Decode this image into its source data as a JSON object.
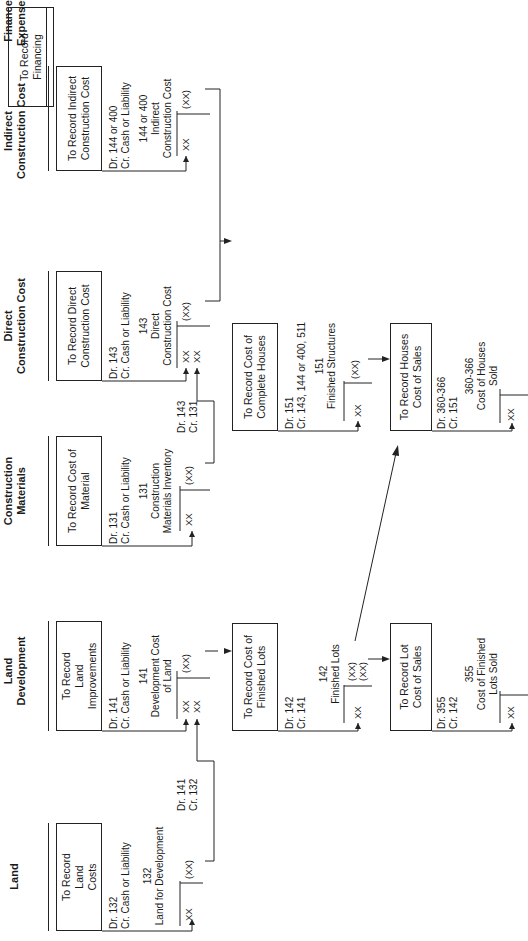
{
  "columns": [
    {
      "header": "Land",
      "box": "To Record Land Costs",
      "entry": [
        "Dr. 132",
        "Cr. Cash or Liability"
      ],
      "account": [
        "132",
        "Land for Development"
      ],
      "debits": [
        "XX"
      ],
      "credits": [
        "(XX)"
      ]
    },
    {
      "header": "Land Development",
      "box": "To Record Land Improvements",
      "entry": [
        "Dr. 141",
        "Cr. Cash or Liability"
      ],
      "account": [
        "141",
        "Development Cost",
        "of Land"
      ],
      "debits": [
        "XX",
        "XX"
      ],
      "credits": [
        "(XX)"
      ]
    },
    {
      "header": "Construction Materials",
      "box": "To Record Cost of Material",
      "entry": [
        "Dr. 131",
        "Cr. Cash or Liability"
      ],
      "account": [
        "131",
        "Construction",
        "Materials Inventory"
      ],
      "debits": [
        "XX"
      ],
      "credits": [
        "(XX)"
      ]
    },
    {
      "header": "Direct Construction Cost",
      "box": "To Record Direct Construction Cost",
      "entry": [
        "Dr. 143",
        "Cr. Cash or Liability"
      ],
      "account": [
        "143",
        "Direct",
        "Construction Cost"
      ],
      "debits": [
        "XX",
        "XX"
      ],
      "credits": [
        "(XX)"
      ]
    },
    {
      "header": "Indirect Construction Cost",
      "box": "To Record Indirect Construction Cost",
      "entry": [
        "Dr. 144 or 400",
        "Cr. Cash or Liability"
      ],
      "account": [
        "144 or 400",
        "Indirect",
        "Construction Cost"
      ],
      "debits": [
        "XX"
      ],
      "credits": [
        "(XX)"
      ]
    },
    {
      "header": "Finance Expenses",
      "box": "To Record Financing"
    }
  ],
  "transfers": {
    "land_to_dev": [
      "Dr. 141",
      "Cr. 132"
    ],
    "materials_to_direct": [
      "Dr. 143",
      "Cr. 131"
    ]
  },
  "finished_lots": {
    "box": "To Record Cost of Finished Lots",
    "entry": [
      "Dr. 142",
      "Cr. 141"
    ],
    "account": [
      "142",
      "Finished Lots"
    ],
    "debits": [
      "XX"
    ],
    "credits": [
      "(XX)",
      "(XX)"
    ]
  },
  "complete_houses": {
    "box": "To Record Cost of Complete Houses",
    "entry": [
      "Dr. 151",
      "Cr. 143, 144 or 400, 511"
    ],
    "account": [
      "151",
      "Finished Structures"
    ],
    "debits": [
      "XX"
    ],
    "credits": [
      "(XX)"
    ]
  },
  "lot_cost_of_sales": {
    "box": "To Record Lot Cost of Sales",
    "entry": [
      "Dr. 355",
      "Cr. 142"
    ],
    "account": [
      "355",
      "Cost of Finished",
      "Lots Sold"
    ],
    "debits": [
      "XX"
    ]
  },
  "houses_cost_of_sales": {
    "box": "To Record Houses Cost of Sales",
    "entry": [
      "Dr. 360-366",
      "Cr. 151"
    ],
    "account": [
      "360-366",
      "Cost of Houses",
      "Sold"
    ],
    "debits": [
      "XX"
    ]
  }
}
